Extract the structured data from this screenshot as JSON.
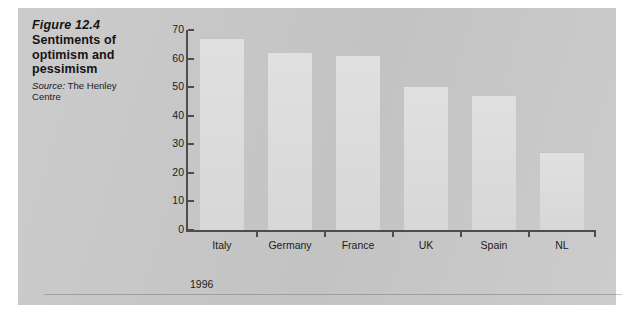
{
  "figure": {
    "number": "Figure 12.4",
    "title": "Sentiments of optimism and pessimism",
    "source_word": "Source:",
    "source_text": " The Henley Centre"
  },
  "colors": {
    "panel_background": "#c9c9c9",
    "axis": "#4d4d4d",
    "bar_fill": "#d3d3d3",
    "text": "#1c1c1c"
  },
  "series_label": "1996",
  "chart_data": {
    "type": "bar",
    "title": "Sentiments of optimism and pessimism",
    "categories": [
      "Italy",
      "Germany",
      "France",
      "UK",
      "Spain",
      "NL"
    ],
    "series": [
      {
        "name": "1996",
        "values": [
          67,
          62,
          61,
          50,
          47,
          27
        ]
      }
    ],
    "values": [
      67,
      62,
      61,
      50,
      47,
      27
    ],
    "xlabel": "",
    "ylabel": "",
    "ylim": [
      0,
      70
    ],
    "yticks": [
      0,
      10,
      20,
      30,
      40,
      50,
      60,
      70
    ],
    "ytick_labels": [
      "0",
      "10",
      "20",
      "30",
      "40",
      "50",
      "60",
      "70"
    ],
    "grid": false,
    "legend": "none"
  }
}
